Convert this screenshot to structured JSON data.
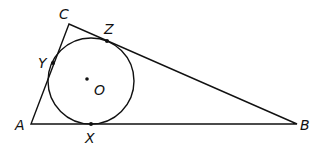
{
  "diagram": {
    "stroke_color": "#111111",
    "background": "#ffffff",
    "vertices": {
      "A": {
        "label": "A",
        "x": 31,
        "y": 124
      },
      "B": {
        "label": "B",
        "x": 297,
        "y": 124
      },
      "C": {
        "label": "C",
        "x": 69,
        "y": 24
      }
    },
    "incircle": {
      "center_label": "O",
      "cx": 91,
      "cy": 81,
      "r": 43
    },
    "tangent_points": {
      "X": {
        "label": "X",
        "x": 91,
        "y": 124,
        "side": "AB"
      },
      "Y": {
        "label": "Y",
        "x": 53,
        "y": 63,
        "side": "AC"
      },
      "Z": {
        "label": "Z",
        "x": 107,
        "y": 41,
        "side": "BC"
      }
    },
    "labels": {
      "A": "A",
      "B": "B",
      "C": "C",
      "O": "O",
      "X": "X",
      "Y": "Y",
      "Z": "Z"
    }
  }
}
